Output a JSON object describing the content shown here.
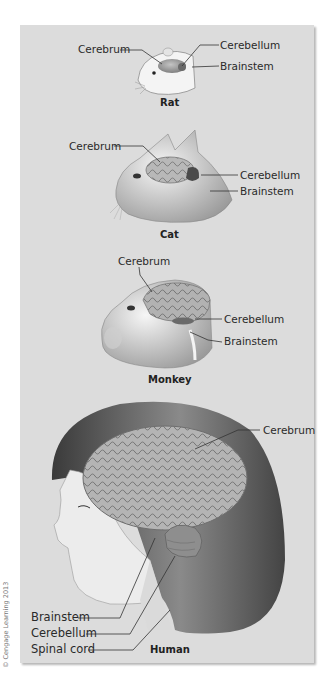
{
  "figure": {
    "panels": [
      {
        "species": "Rat",
        "labels": [
          "Cerebrum",
          "Cerebellum",
          "Brainstem"
        ]
      },
      {
        "species": "Cat",
        "labels": [
          "Cerebrum",
          "Cerebellum",
          "Brainstem"
        ]
      },
      {
        "species": "Monkey",
        "labels": [
          "Cerebrum",
          "Cerebellum",
          "Brainstem"
        ]
      },
      {
        "species": "Human",
        "labels": [
          "Cerebrum",
          "Brainstem",
          "Cerebellum",
          "Spinal cord"
        ]
      }
    ],
    "credit": "© Cengage Learning 2013",
    "colors": {
      "background": "#dcdcdc",
      "leader_line": "#333333",
      "brain": "#a8a8a8",
      "skin": "#ececec"
    }
  }
}
